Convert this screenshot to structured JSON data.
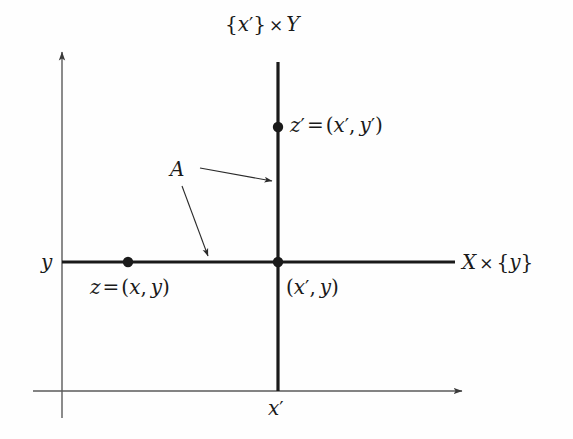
{
  "figure": {
    "background_color": "#fefefe",
    "ink_color": "#1a1a1a",
    "axis_color": "#555555",
    "labels": {
      "top_axis": "{x'} × Y",
      "right_axis": "X × {y}",
      "y_axis": "y",
      "bottom_axis": "x'",
      "point_z_prime": "z' = (x', y')",
      "point_z": "z = (x, y)",
      "point_intersection": "(x', y)",
      "set_a": "A"
    },
    "geometry": {
      "axis_origin_x": 62,
      "axis_origin_y": 391,
      "vertical_slice_x": 278,
      "horizontal_slice_y": 262,
      "vertical_slice_top_y": 62,
      "horizontal_slice_left_x": 62,
      "horizontal_slice_right_x": 455
    },
    "points": [
      {
        "name": "z-prime",
        "x": 278,
        "y": 127,
        "label": "z' = (x', y')",
        "filled": true
      },
      {
        "name": "z",
        "x": 128,
        "y": 262,
        "label": "z = (x, y)",
        "filled": true
      },
      {
        "name": "intersection",
        "x": 278,
        "y": 262,
        "label": "(x', y)",
        "filled": true
      }
    ],
    "annotations": [
      {
        "name": "a-to-vertical-slice",
        "from_x": 200,
        "from_y": 168,
        "to_x": 274,
        "to_y": 181
      },
      {
        "name": "a-to-horizontal-slice",
        "from_x": 182,
        "from_y": 186,
        "to_x": 208,
        "to_y": 258
      }
    ]
  }
}
